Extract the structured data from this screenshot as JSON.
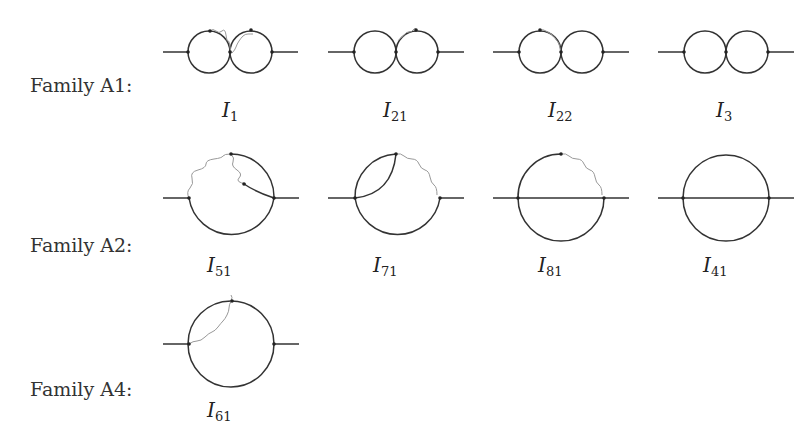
{
  "families": [
    {
      "label": "Family A1:",
      "diagrams": [
        {
          "id": "I1",
          "symbol": "I",
          "subscript": "1",
          "type": "double-bubble",
          "photon": "both-loops"
        },
        {
          "id": "I21",
          "symbol": "I",
          "subscript": "21",
          "type": "double-bubble",
          "photon": "right-loop"
        },
        {
          "id": "I22",
          "symbol": "I",
          "subscript": "22",
          "type": "double-bubble",
          "photon": "left-loop"
        },
        {
          "id": "I3",
          "symbol": "I",
          "subscript": "3",
          "type": "double-bubble",
          "photon": "none"
        }
      ]
    },
    {
      "label": "Family A2:",
      "diagrams": [
        {
          "id": "I51",
          "symbol": "I",
          "subscript": "51",
          "type": "sunset-variant",
          "photon": "top-left-arc-and-inner"
        },
        {
          "id": "I71",
          "symbol": "I",
          "subscript": "71",
          "type": "sunset-variant",
          "photon": "top-right-arc"
        },
        {
          "id": "I81",
          "symbol": "I",
          "subscript": "81",
          "type": "sunrise",
          "photon": "top-right-arc"
        },
        {
          "id": "I41",
          "symbol": "I",
          "subscript": "41",
          "type": "sunrise",
          "photon": "none"
        }
      ]
    },
    {
      "label": "Family A4:",
      "diagrams": [
        {
          "id": "I61",
          "symbol": "I",
          "subscript": "61",
          "type": "self-energy",
          "photon": "internal-chord"
        }
      ]
    }
  ]
}
